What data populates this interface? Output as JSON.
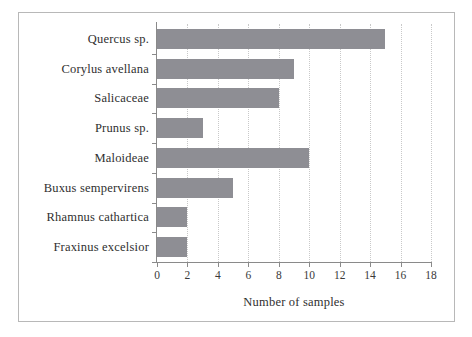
{
  "chart_data": {
    "type": "bar",
    "orientation": "horizontal",
    "title": "",
    "xlabel": "Number of samples",
    "ylabel": "",
    "categories": [
      "Quercus sp.",
      "Corylus avellana",
      "Salicaceae",
      "Prunus sp.",
      "Maloideae",
      "Buxus sempervirens",
      "Rhamnus cathartica",
      "Fraxinus excelsior"
    ],
    "values": [
      15,
      9,
      8,
      3,
      10,
      5,
      2,
      2
    ],
    "xlim": [
      0,
      18
    ],
    "xticks": [
      0,
      2,
      4,
      6,
      8,
      10,
      12,
      14,
      16,
      18
    ],
    "xtick_labels": [
      "0",
      "2",
      "4",
      "6",
      "8",
      "10",
      "12",
      "14",
      "16",
      "18"
    ],
    "grid": "vertical-dotted",
    "legend": "none",
    "bar_color": "#8e8e94",
    "axis_color": "#8a8a8a",
    "gridline_color": "#c9c9c9",
    "frame_color": "#b8b8b8",
    "text_color": "#2f2f2f",
    "background_color": "#ffffff"
  }
}
